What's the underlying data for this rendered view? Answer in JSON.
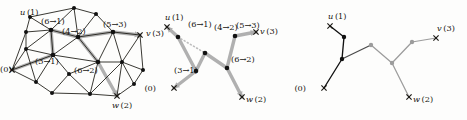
{
  "figure": {
    "type": "graph-diagram",
    "panel_count": 3,
    "colors": {
      "ink": "#15140f",
      "node_dark": "#111111",
      "highlight_gray": "#a8a8a8",
      "edge_gray": "#9c9c9c",
      "paper": "#fdfdfc"
    }
  },
  "terminals": {
    "u": "u (1)",
    "v": "v (3)",
    "w": "w (2)",
    "root": "(0)"
  },
  "edge_labels": {
    "e61": "(6→1)",
    "e42": "(4→2)",
    "e53": "(5→3)",
    "e31": "(3→1)",
    "e62": "(6→2)"
  },
  "panel1": {
    "name": "triangulated-graph",
    "caption": "",
    "terminal_labels": [
      "u (1)",
      "v (3)",
      "w (2)",
      "(0)"
    ],
    "edge_labels": [
      "(6→1)",
      "(4→2)",
      "(5→3)",
      "(3→1)",
      "(6→2)"
    ],
    "vertex_count": 20,
    "nodes": [
      {
        "id": "n0",
        "x": 12,
        "y": 70,
        "kind": "terminal",
        "label": "(0)"
      },
      {
        "id": "n1",
        "x": 26,
        "y": 32,
        "kind": "plain"
      },
      {
        "id": "n2",
        "x": 30,
        "y": 17,
        "kind": "plain"
      },
      {
        "id": "n3",
        "x": 51,
        "y": 30,
        "kind": "hub"
      },
      {
        "id": "n4",
        "x": 74,
        "y": 8,
        "kind": "plain"
      },
      {
        "id": "n5",
        "x": 96,
        "y": 14,
        "kind": "plain"
      },
      {
        "id": "n6",
        "x": 78,
        "y": 37,
        "kind": "hub"
      },
      {
        "id": "n7",
        "x": 113,
        "y": 32,
        "kind": "hub"
      },
      {
        "id": "n8",
        "x": 140,
        "y": 35,
        "kind": "terminal",
        "label": "v (3)"
      },
      {
        "id": "n9",
        "x": 53,
        "y": 55,
        "kind": "hub"
      },
      {
        "id": "n10",
        "x": 98,
        "y": 62,
        "kind": "hub"
      },
      {
        "id": "n11",
        "x": 122,
        "y": 62,
        "kind": "plain"
      },
      {
        "id": "n12",
        "x": 143,
        "y": 70,
        "kind": "plain"
      },
      {
        "id": "n13",
        "x": 69,
        "y": 74,
        "kind": "plain"
      },
      {
        "id": "n14",
        "x": 36,
        "y": 82,
        "kind": "plain"
      },
      {
        "id": "n15",
        "x": 52,
        "y": 93,
        "kind": "plain"
      },
      {
        "id": "n16",
        "x": 90,
        "y": 94,
        "kind": "plain"
      },
      {
        "id": "n17",
        "x": 117,
        "y": 96,
        "kind": "terminal",
        "label": "w (2)"
      },
      {
        "id": "n18",
        "x": 134,
        "y": 84,
        "kind": "plain"
      },
      {
        "id": "n19",
        "x": 26,
        "y": 49,
        "kind": "plain"
      }
    ],
    "edges": [
      [
        "n0",
        "n1"
      ],
      [
        "n0",
        "n19"
      ],
      [
        "n0",
        "n14"
      ],
      [
        "n0",
        "n9"
      ],
      [
        "n1",
        "n2"
      ],
      [
        "n1",
        "n19"
      ],
      [
        "n1",
        "n3"
      ],
      [
        "n2",
        "n3"
      ],
      [
        "n2",
        "n4"
      ],
      [
        "n3",
        "n4"
      ],
      [
        "n3",
        "n6"
      ],
      [
        "n3",
        "n19"
      ],
      [
        "n3",
        "n9"
      ],
      [
        "n4",
        "n5"
      ],
      [
        "n4",
        "n6"
      ],
      [
        "n5",
        "n6"
      ],
      [
        "n5",
        "n7"
      ],
      [
        "n6",
        "n7"
      ],
      [
        "n6",
        "n9"
      ],
      [
        "n6",
        "n10"
      ],
      [
        "n7",
        "n8"
      ],
      [
        "n7",
        "n10"
      ],
      [
        "n7",
        "n11"
      ],
      [
        "n8",
        "n11"
      ],
      [
        "n8",
        "n12"
      ],
      [
        "n9",
        "n13"
      ],
      [
        "n9",
        "n14"
      ],
      [
        "n9",
        "n10"
      ],
      [
        "n10",
        "n11"
      ],
      [
        "n10",
        "n13"
      ],
      [
        "n10",
        "n16"
      ],
      [
        "n11",
        "n12"
      ],
      [
        "n11",
        "n16"
      ],
      [
        "n11",
        "n18"
      ],
      [
        "n12",
        "n18"
      ],
      [
        "n13",
        "n15"
      ],
      [
        "n13",
        "n16"
      ],
      [
        "n14",
        "n15"
      ],
      [
        "n14",
        "n19"
      ],
      [
        "n15",
        "n16"
      ],
      [
        "n16",
        "n17"
      ],
      [
        "n17",
        "n18"
      ],
      [
        "n17",
        "n11"
      ],
      [
        "n19",
        "n9"
      ]
    ],
    "highlight_paths": [
      [
        "n0",
        "n9",
        "n3"
      ],
      [
        "n3",
        "n6"
      ],
      [
        "n6",
        "n10"
      ],
      [
        "n6",
        "n7"
      ],
      [
        "n7",
        "n8"
      ],
      [
        "n10",
        "n17"
      ]
    ]
  },
  "panel2": {
    "name": "labeled-skeleton-tree",
    "terminal_labels": [
      "u (1)",
      "v (3)",
      "w (2)",
      "(0)"
    ],
    "nodes": [
      {
        "id": "b1",
        "x": 20,
        "y": 37,
        "kind": "branch"
      },
      {
        "id": "b2",
        "x": 47,
        "y": 53,
        "kind": "branch"
      },
      {
        "id": "b3",
        "x": 38,
        "y": 71,
        "kind": "branch"
      },
      {
        "id": "b4",
        "x": 77,
        "y": 36,
        "kind": "branch"
      },
      {
        "id": "b5",
        "x": 69,
        "y": 68,
        "kind": "branch"
      }
    ],
    "terminals": [
      {
        "id": "tu",
        "x": 9,
        "y": 27,
        "label": "u (1)",
        "label_dx": -2,
        "label_dy": -7
      },
      {
        "id": "tv",
        "x": 98,
        "y": 32,
        "label": "v (3)",
        "label_dx": 4,
        "label_dy": 2
      },
      {
        "id": "tw",
        "x": 84,
        "y": 97,
        "label": "w (2)",
        "label_dx": 4,
        "label_dy": 5
      },
      {
        "id": "t0",
        "x": 16,
        "y": 88,
        "label": "(0)",
        "label_dx": -18,
        "label_dy": 3
      }
    ],
    "edges": [
      {
        "from": "b1",
        "to": "tu",
        "label": "",
        "arrow": true
      },
      {
        "from": "b1",
        "to": "b2",
        "label": "(6→1)",
        "arrow": false,
        "dotted": true
      },
      {
        "from": "b1",
        "to": "b3",
        "label": "",
        "arrow": false
      },
      {
        "from": "b3",
        "to": "b2",
        "label": "(3→1)",
        "arrow": false
      },
      {
        "from": "b3",
        "to": "t0",
        "label": "",
        "arrow": true
      },
      {
        "from": "b2",
        "to": "b5",
        "label": "(4→2)",
        "arrow": false
      },
      {
        "from": "b5",
        "to": "b4",
        "label": "(6→2)",
        "arrow": false
      },
      {
        "from": "b5",
        "to": "tw",
        "label": "",
        "arrow": true
      },
      {
        "from": "b4",
        "to": "tv",
        "label": "(5→3)",
        "arrow": true
      }
    ],
    "label_positions": [
      {
        "text": "(6→1)",
        "x": 30,
        "y": 27
      },
      {
        "text": "(4→2)",
        "x": 56,
        "y": 30
      },
      {
        "text": "(5→3)",
        "x": 78,
        "y": 28
      },
      {
        "text": "(3→1)",
        "x": 16,
        "y": 73
      },
      {
        "text": "(6→2)",
        "x": 73,
        "y": 62
      }
    ]
  },
  "panel3": {
    "name": "two-colored-tree",
    "terminal_labels": [
      "u (1)",
      "v (3)",
      "w (2)",
      "(0)"
    ],
    "dark_branch": {
      "color": "#111111",
      "nodes": [
        {
          "id": "d1",
          "x": 36,
          "y": 37
        },
        {
          "id": "d2",
          "x": 34,
          "y": 59
        }
      ],
      "terminals": [
        {
          "id": "du",
          "x": 22,
          "y": 26,
          "label": "u (1)",
          "label_dx": -2,
          "label_dy": -7
        },
        {
          "id": "d0",
          "x": 16,
          "y": 88,
          "label": "(0)",
          "label_dx": -18,
          "label_dy": 3
        }
      ],
      "edges": [
        [
          "du",
          "d1"
        ],
        [
          "d1",
          "d2"
        ],
        [
          "d2",
          "d0"
        ]
      ]
    },
    "light_branch": {
      "color": "#9c9c9c",
      "nodes": [
        {
          "id": "g1",
          "x": 63,
          "y": 45
        },
        {
          "id": "g2",
          "x": 84,
          "y": 63
        },
        {
          "id": "g3",
          "x": 104,
          "y": 42
        }
      ],
      "terminals": [
        {
          "id": "gv",
          "x": 128,
          "y": 38,
          "label": "v (3)",
          "label_dx": 1,
          "label_dy": -7
        },
        {
          "id": "gw",
          "x": 101,
          "y": 97,
          "label": "w (2)",
          "label_dx": 4,
          "label_dy": 5
        }
      ],
      "edges": [
        [
          "g1",
          "g2"
        ],
        [
          "g2",
          "g3"
        ],
        [
          "g3",
          "gv"
        ],
        [
          "g2",
          "gw"
        ]
      ]
    },
    "link_edge": {
      "from": "d2",
      "to": "g1",
      "color": "#4a4a4a"
    }
  }
}
